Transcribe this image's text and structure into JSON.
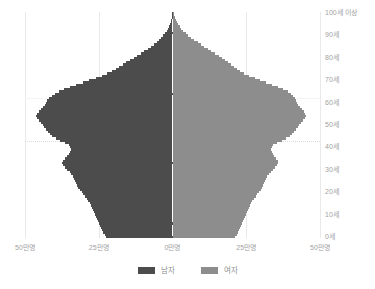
{
  "chart_data": {
    "type": "bar",
    "subtype": "population-pyramid",
    "title": "",
    "xlabel": "",
    "ylabel": "",
    "orientation": "horizontal",
    "grid": true,
    "legend_position": "bottom",
    "xlim": [
      -50,
      50
    ],
    "ylim": [
      0,
      100
    ],
    "x_unit": "만명",
    "y_unit": "세",
    "xticks": [
      -50,
      -25,
      0,
      25,
      50
    ],
    "xtick_labels": [
      "50만명",
      "25만명",
      "0만명",
      "25만명",
      "50만명"
    ],
    "yticks": [
      0,
      10,
      20,
      30,
      40,
      50,
      60,
      70,
      80,
      90,
      100
    ],
    "ytick_labels": [
      "0세",
      "10세",
      "20세",
      "30세",
      "40세",
      "50세",
      "60세",
      "70세",
      "80세",
      "90세",
      "100세 이상"
    ],
    "series": [
      {
        "name": "남자",
        "color": "#4c4c4c",
        "side": "left",
        "values": [
          22.5,
          23.0,
          23.4,
          23.8,
          24.2,
          24.6,
          25.0,
          25.3,
          25.6,
          25.9,
          26.2,
          26.5,
          26.8,
          27.2,
          27.6,
          28.0,
          28.5,
          29.0,
          29.6,
          30.2,
          30.8,
          31.4,
          31.9,
          32.3,
          32.7,
          33.0,
          33.4,
          33.8,
          34.3,
          34.9,
          35.6,
          36.4,
          37.1,
          37.5,
          37.2,
          36.5,
          35.8,
          35.2,
          34.8,
          34.5,
          34.6,
          35.2,
          36.4,
          38.0,
          39.6,
          40.8,
          41.6,
          42.2,
          42.8,
          43.4,
          44.0,
          44.6,
          45.2,
          45.8,
          46.2,
          46.0,
          45.4,
          44.6,
          43.8,
          43.2,
          42.8,
          42.4,
          41.8,
          41.0,
          40.0,
          38.6,
          36.8,
          34.8,
          32.6,
          30.4,
          28.2,
          26.0,
          24.0,
          22.2,
          20.6,
          19.2,
          18.0,
          16.8,
          15.6,
          14.4,
          13.2,
          12.0,
          10.8,
          9.6,
          8.4,
          7.2,
          6.2,
          5.3,
          4.5,
          3.8,
          3.1,
          2.5,
          2.0,
          1.6,
          1.2,
          0.9,
          0.65,
          0.45,
          0.3,
          0.2,
          0.12
        ]
      },
      {
        "name": "여자",
        "color": "#8d8d8d",
        "side": "right",
        "values": [
          21.3,
          21.8,
          22.2,
          22.6,
          23.0,
          23.3,
          23.7,
          24.0,
          24.3,
          24.6,
          24.9,
          25.2,
          25.5,
          25.9,
          26.3,
          26.7,
          27.1,
          27.6,
          28.2,
          28.8,
          29.4,
          29.9,
          30.4,
          30.8,
          31.1,
          31.4,
          31.8,
          32.2,
          32.7,
          33.3,
          34.0,
          34.8,
          35.5,
          35.9,
          35.6,
          35.0,
          34.4,
          33.9,
          33.6,
          33.4,
          33.6,
          34.2,
          35.4,
          37.0,
          38.6,
          39.8,
          40.6,
          41.2,
          41.8,
          42.4,
          43.0,
          43.6,
          44.2,
          44.8,
          45.2,
          45.0,
          44.5,
          43.8,
          43.1,
          42.6,
          42.3,
          42.0,
          41.6,
          41.0,
          40.2,
          39.0,
          37.5,
          35.8,
          33.8,
          31.8,
          29.8,
          27.8,
          26.0,
          24.4,
          23.0,
          21.8,
          20.8,
          19.8,
          18.8,
          17.8,
          16.8,
          15.6,
          14.4,
          13.2,
          12.0,
          10.8,
          9.6,
          8.5,
          7.4,
          6.4,
          5.4,
          4.5,
          3.7,
          3.0,
          2.4,
          1.9,
          1.45,
          1.05,
          0.75,
          0.5,
          0.35
        ]
      }
    ],
    "highlight_lines": [
      {
        "age": 62,
        "style": "solid"
      },
      {
        "age": 43,
        "style": "dotted"
      }
    ]
  },
  "legend": {
    "items": [
      {
        "label": "남자",
        "color": "#4c4c4c",
        "icon": "legend-swatch-male"
      },
      {
        "label": "여자",
        "color": "#8d8d8d",
        "icon": "legend-swatch-female"
      }
    ]
  },
  "colors": {
    "male": "#4c4c4c",
    "female": "#8d8d8d",
    "background": "#ffffff",
    "gridline": "#e9e9e9",
    "axis_text": "#a2a2a2"
  }
}
